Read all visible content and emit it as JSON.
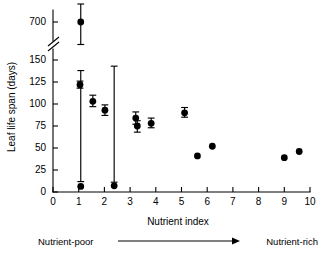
{
  "chart_data": {
    "type": "scatter",
    "title": "",
    "xlabel": "Nutrient index",
    "ylabel": "Leaf life span (days)",
    "xlim": [
      0,
      10
    ],
    "ylim": [
      0,
      150
    ],
    "grid": false,
    "legend": "none",
    "axis_break": {
      "present": true,
      "axis": "y",
      "between": [
        150,
        700
      ],
      "symbol": "double-slash"
    },
    "xticks": [
      0,
      1,
      2,
      3,
      4,
      5,
      6,
      7,
      8,
      9,
      10
    ],
    "xtick_labels": [
      "0",
      "1",
      "2",
      "3",
      "4",
      "5",
      "6",
      "7",
      "8",
      "9",
      "10"
    ],
    "yticks": [
      0,
      25,
      50,
      75,
      100,
      125,
      150,
      700
    ],
    "ytick_labels": [
      "0",
      "25",
      "50",
      "75",
      "100",
      "125",
      "150",
      "700"
    ],
    "points": [
      {
        "x": 1.08,
        "y": 700,
        "yerr_low": 625,
        "yerr_high": 760,
        "has_error_bar": true
      },
      {
        "x": 1.08,
        "y": 152,
        "yerr_low": 138,
        "yerr_high": 168,
        "has_error_bar": true
      },
      {
        "x": 1.05,
        "y": 122,
        "yerr_low": 118,
        "yerr_high": 126,
        "has_error_bar": true
      },
      {
        "x": 1.55,
        "y": 103,
        "yerr_low": 97,
        "yerr_high": 110,
        "has_error_bar": true
      },
      {
        "x": 2.02,
        "y": 93,
        "yerr_low": 87,
        "yerr_high": 99,
        "has_error_bar": true
      },
      {
        "x": 2.38,
        "y": 154,
        "yerr_low": 143,
        "yerr_high": 166,
        "has_error_bar": true
      },
      {
        "x": 3.22,
        "y": 84,
        "yerr_low": 77,
        "yerr_high": 91,
        "has_error_bar": true
      },
      {
        "x": 3.28,
        "y": 75,
        "yerr_low": 68,
        "yerr_high": 81,
        "has_error_bar": true
      },
      {
        "x": 3.82,
        "y": 78,
        "yerr_low": 73,
        "yerr_high": 84,
        "has_error_bar": true
      },
      {
        "x": 5.12,
        "y": 90,
        "yerr_low": 85,
        "yerr_high": 96,
        "has_error_bar": true
      },
      {
        "x": 5.62,
        "y": 41,
        "has_error_bar": false
      },
      {
        "x": 6.2,
        "y": 52,
        "has_error_bar": false
      },
      {
        "x": 9.0,
        "y": 39,
        "has_error_bar": false
      },
      {
        "x": 9.58,
        "y": 46,
        "has_error_bar": false
      }
    ],
    "annotations": [
      {
        "name": "nutrient-poor",
        "text": "Nutrient-poor",
        "position": "bottom-left"
      },
      {
        "name": "nutrient-rich",
        "text": "Nutrient-rich",
        "position": "bottom-right"
      },
      {
        "name": "gradient-arrow",
        "text": "",
        "position": "bottom-center"
      }
    ]
  },
  "colors": {
    "marker": "#000000",
    "axis": "#000000",
    "background": "#ffffff"
  }
}
